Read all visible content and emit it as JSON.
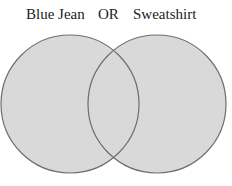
{
  "diagram": {
    "type": "venn",
    "sets": [
      {
        "label": "Blue Jean"
      },
      {
        "label": "Sweatshirt"
      }
    ],
    "operator": "OR",
    "shaded_regions": [
      "Blue Jean only",
      "intersection",
      "Sweatshirt only"
    ],
    "colors": {
      "fill": "#d9d9d9",
      "stroke": "#6e6e6e"
    }
  }
}
